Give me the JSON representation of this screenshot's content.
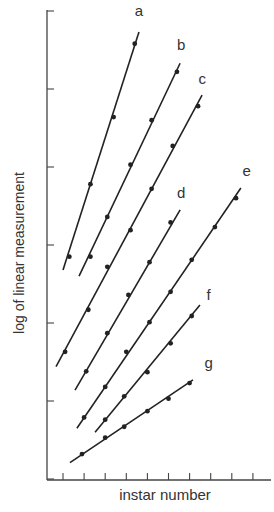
{
  "chart_data": {
    "type": "line",
    "title": "",
    "xlabel": "instar number",
    "ylabel": "log of linear measurement",
    "x_ticks": 10,
    "y_ticks": 6,
    "xlim": [
      0.3,
      11
    ],
    "ylim": [
      0,
      6
    ],
    "grid": false,
    "legend": "inline labels at line ends",
    "series": [
      {
        "name": "a",
        "points": [
          [
            1.3,
            2.85
          ],
          [
            2.3,
            3.78
          ],
          [
            3.4,
            4.64
          ],
          [
            4.4,
            5.58
          ]
        ],
        "line": [
          [
            1.0,
            2.68
          ],
          [
            4.6,
            5.73
          ]
        ]
      },
      {
        "name": "b",
        "points": [
          [
            2.3,
            2.85
          ],
          [
            3.1,
            3.36
          ],
          [
            4.2,
            4.03
          ],
          [
            5.2,
            4.6
          ],
          [
            6.4,
            5.22
          ]
        ],
        "line": [
          [
            1.76,
            2.6
          ],
          [
            6.55,
            5.33
          ]
        ]
      },
      {
        "name": "c",
        "points": [
          [
            1.1,
            1.63
          ],
          [
            2.2,
            2.17
          ],
          [
            3.1,
            2.72
          ],
          [
            4.2,
            3.19
          ],
          [
            5.2,
            3.72
          ],
          [
            6.2,
            4.27
          ],
          [
            7.4,
            4.78
          ]
        ],
        "line": [
          [
            0.67,
            1.44
          ],
          [
            7.59,
            4.92
          ]
        ]
      },
      {
        "name": "d",
        "points": [
          [
            2.1,
            1.38
          ],
          [
            3.1,
            1.87
          ],
          [
            4.1,
            2.36
          ],
          [
            5.1,
            2.78
          ],
          [
            6.1,
            3.29
          ]
        ],
        "line": [
          [
            1.57,
            1.14
          ],
          [
            6.55,
            3.45
          ]
        ]
      },
      {
        "name": "e",
        "points": [
          [
            2.0,
            0.79
          ],
          [
            3.0,
            1.18
          ],
          [
            4.0,
            1.63
          ],
          [
            5.1,
            2.01
          ],
          [
            6.1,
            2.4
          ],
          [
            7.1,
            2.81
          ],
          [
            8.2,
            3.23
          ],
          [
            9.2,
            3.6
          ]
        ],
        "line": [
          [
            1.66,
            0.65
          ],
          [
            9.43,
            3.73
          ]
        ]
      },
      {
        "name": "f",
        "points": [
          [
            3.0,
            0.76
          ],
          [
            3.9,
            1.06
          ],
          [
            5.0,
            1.37
          ],
          [
            6.1,
            1.74
          ],
          [
            7.1,
            2.09
          ]
        ],
        "line": [
          [
            2.52,
            0.6
          ],
          [
            7.49,
            2.23
          ]
        ]
      },
      {
        "name": "g",
        "points": [
          [
            1.9,
            0.32
          ],
          [
            3.0,
            0.53
          ],
          [
            3.9,
            0.67
          ],
          [
            5.0,
            0.87
          ],
          [
            6.0,
            1.03
          ],
          [
            7.0,
            1.23
          ]
        ],
        "line": [
          [
            1.33,
            0.21
          ],
          [
            7.16,
            1.27
          ]
        ]
      }
    ],
    "labels": [
      {
        "text": "a",
        "x": 4.6,
        "y": 5.93
      },
      {
        "text": "b",
        "x": 6.6,
        "y": 5.5
      },
      {
        "text": "c",
        "x": 7.6,
        "y": 5.07
      },
      {
        "text": "d",
        "x": 6.6,
        "y": 3.6
      },
      {
        "text": "e",
        "x": 9.7,
        "y": 3.88
      },
      {
        "text": "f",
        "x": 7.9,
        "y": 2.3
      },
      {
        "text": "g",
        "x": 7.9,
        "y": 1.42
      }
    ]
  },
  "axes": {
    "xlabel": "instar number",
    "ylabel": "log of linear measurement"
  }
}
